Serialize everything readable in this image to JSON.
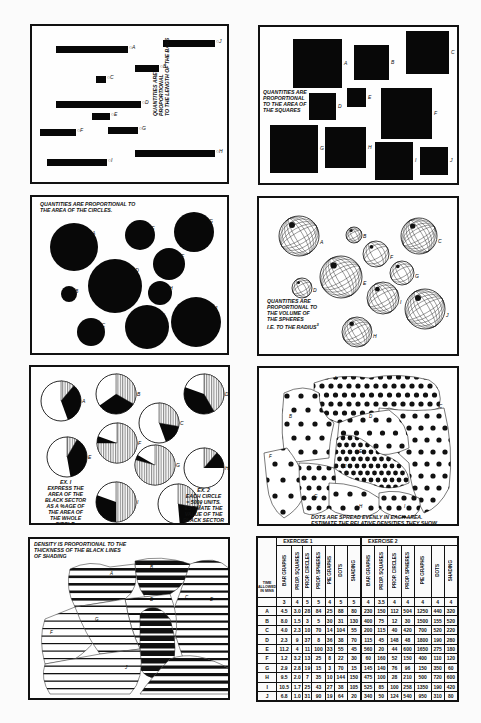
{
  "panels": {
    "bars": {
      "caption_line1": "QUANTITIES ARE PROPORTIONAL",
      "caption_line2": "TO THE LENGTH OF THE BARS",
      "items": [
        {
          "label": "A",
          "x": 16,
          "y": 20,
          "w": 72
        },
        {
          "label": "B",
          "x": 95,
          "y": 39,
          "w": 24
        },
        {
          "label": "C",
          "x": 56,
          "y": 50,
          "w": 10
        },
        {
          "label": "D",
          "x": 16,
          "y": 75,
          "w": 85
        },
        {
          "label": "E",
          "x": 52,
          "y": 87,
          "w": 18
        },
        {
          "label": "F",
          "x": 0,
          "y": 103,
          "w": 36
        },
        {
          "label": "G",
          "x": 68,
          "y": 101,
          "w": 30
        },
        {
          "label": "H",
          "x": 95,
          "y": 124,
          "w": 80
        },
        {
          "label": "I",
          "x": 7,
          "y": 133,
          "w": 60
        },
        {
          "label": "J",
          "x": 123,
          "y": 14,
          "w": 52
        }
      ]
    },
    "squares": {
      "caption_line1": "QUANTITIES ARE",
      "caption_line2": "PROPORTIONAL",
      "caption_line3": "TO THE AREA OF",
      "caption_line4": "THE SQUARES",
      "items": [
        {
          "label": "A",
          "x": 33,
          "y": 12,
          "s": 49
        },
        {
          "label": "B",
          "x": 94,
          "y": 18,
          "s": 35
        },
        {
          "label": "C",
          "x": 146,
          "y": 4,
          "s": 43
        },
        {
          "label": "D",
          "x": 49,
          "y": 66,
          "s": 27
        },
        {
          "label": "E",
          "x": 87,
          "y": 61,
          "s": 19
        },
        {
          "label": "F",
          "x": 121,
          "y": 61,
          "s": 51
        },
        {
          "label": "G",
          "x": 10,
          "y": 98,
          "s": 48
        },
        {
          "label": "H",
          "x": 65,
          "y": 100,
          "s": 41
        },
        {
          "label": "I",
          "x": 115,
          "y": 115,
          "s": 38
        },
        {
          "label": "J",
          "x": 160,
          "y": 120,
          "s": 28
        }
      ]
    },
    "circles": {
      "caption_line1": "QUANTITIES ARE PROPORTIONAL TO",
      "caption_line2": "THE AREA OF THE CIRCLES.",
      "items": [
        {
          "label": "A",
          "cx": 42,
          "cy": 50,
          "r": 24
        },
        {
          "label": "B",
          "cx": 37,
          "cy": 97,
          "r": 8
        },
        {
          "label": "C",
          "cx": 59,
          "cy": 135,
          "r": 14
        },
        {
          "label": "D",
          "cx": 83,
          "cy": 89,
          "r": 27
        },
        {
          "label": "E",
          "cx": 108,
          "cy": 38,
          "r": 15
        },
        {
          "label": "F",
          "cx": 137,
          "cy": 67,
          "r": 16
        },
        {
          "label": "G",
          "cx": 162,
          "cy": 35,
          "r": 20
        },
        {
          "label": "H",
          "cx": 128,
          "cy": 96,
          "r": 12
        },
        {
          "label": "I",
          "cx": 115,
          "cy": 130,
          "r": 22
        },
        {
          "label": "J",
          "cx": 164,
          "cy": 125,
          "r": 25
        }
      ]
    },
    "spheres": {
      "caption_line1": "QUANTITIES ARE",
      "caption_line2": "PROPORTIONAL TO",
      "caption_line3": "THE VOLUME OF",
      "caption_line4": "THE SPHERES",
      "caption_line5": "i.e. TO THE RADIUS",
      "caption_sup": "3",
      "items": [
        {
          "label": "A",
          "cx": 40,
          "cy": 38,
          "r": 20
        },
        {
          "label": "B",
          "cx": 95,
          "cy": 37,
          "r": 8
        },
        {
          "label": "C",
          "cx": 160,
          "cy": 38,
          "r": 18
        },
        {
          "label": "D",
          "cx": 43,
          "cy": 90,
          "r": 10
        },
        {
          "label": "E",
          "cx": 82,
          "cy": 79,
          "r": 21
        },
        {
          "label": "F",
          "cx": 117,
          "cy": 56,
          "r": 13
        },
        {
          "label": "G",
          "cx": 143,
          "cy": 75,
          "r": 12
        },
        {
          "label": "H",
          "cx": 98,
          "cy": 134,
          "r": 15
        },
        {
          "label": "I",
          "cx": 124,
          "cy": 100,
          "r": 16
        },
        {
          "label": "J",
          "cx": 166,
          "cy": 111,
          "r": 20
        }
      ]
    },
    "pies": {
      "ex1_line1": "EX. I",
      "ex1_line2": "EXPRESS THE",
      "ex1_line3": "AREA OF THE",
      "ex1_line4": "BLACK SECTOR",
      "ex1_line5": "AS A %AGE OF",
      "ex1_line6": "THE AREA OF",
      "ex1_line7": "THE WHOLE",
      "ex1_line8": "CIRCLE.",
      "ex2_line1": "EX. 2",
      "ex2_line2": "EACH CIRCLE",
      "ex2_line3": "= 5000 UNITS.",
      "ex2_line4": "ESTIMATE THE",
      "ex2_line5": "VALUE OF THE",
      "ex2_line6": "BLACK SECTOR",
      "items": [
        {
          "label": "A",
          "cx": 30,
          "cy": 34,
          "r": 20,
          "hatch": [
            0,
            40
          ],
          "black": [
            40,
            160
          ]
        },
        {
          "label": "B",
          "cx": 85,
          "cy": 27,
          "r": 20,
          "hatch": [
            0,
            120
          ],
          "black": [
            120,
            235
          ]
        },
        {
          "label": "C",
          "cx": 128,
          "cy": 56,
          "r": 20,
          "hatch": [
            0,
            100
          ],
          "black": [
            100,
            160
          ]
        },
        {
          "label": "D",
          "cx": 173,
          "cy": 27,
          "r": 20,
          "hatch": [
            0,
            150
          ],
          "black": [
            150,
            290
          ]
        },
        {
          "label": "E",
          "cx": 36,
          "cy": 90,
          "r": 20,
          "hatch": [
            0,
            30
          ],
          "black": [
            30,
            170
          ]
        },
        {
          "label": "F",
          "cx": 86,
          "cy": 76,
          "r": 20,
          "hatch": [
            0,
            270
          ],
          "black": [
            270,
            290
          ]
        },
        {
          "label": "G",
          "cx": 124,
          "cy": 98,
          "r": 20,
          "hatch": [
            0,
            285
          ],
          "black": [
            285,
            300
          ]
        },
        {
          "label": "H",
          "cx": 173,
          "cy": 101,
          "r": 20,
          "hatch": [
            0,
            40
          ],
          "black": [
            40,
            90
          ]
        },
        {
          "label": "I",
          "cx": 85,
          "cy": 135,
          "r": 20,
          "hatch": [
            0,
            180
          ],
          "black": [
            180,
            290
          ]
        },
        {
          "label": "J",
          "cx": 147,
          "cy": 137,
          "r": 20,
          "hatch": [
            0,
            100
          ],
          "black": [
            100,
            175
          ]
        }
      ]
    },
    "dots": {
      "caption_line1": "DOTS ARE SPREAD EVENLY IN EACH AREA.",
      "caption_line2": "ESTIMATE THE RELATIVE DENSITIES THEY SHOW",
      "region_labels": [
        "A",
        "B",
        "C",
        "D",
        "E",
        "F",
        "G",
        "H",
        "I",
        "J"
      ]
    },
    "shading": {
      "caption_line1": "DENSITY IS PROPORTIONAL TO THE",
      "caption_line2": "THICKNESS OF THE BLACK LINES",
      "caption_line3": "OF SHADING",
      "region_labels": [
        "A",
        "B",
        "C",
        "D",
        "E",
        "F",
        "G",
        "J"
      ]
    },
    "table": {
      "exercise1_title": "EXERCISE 1",
      "exercise2_title": "EXERCISE 2",
      "corner_label": "TIME ALLOWED IN MINS",
      "columns": [
        "BAR GRAPHS",
        "PROP. SQUARES",
        "PROP. CIRCLES",
        "PROP. SPHERES",
        "PIE GRAPHS",
        "DOTS",
        "SHADING"
      ],
      "time_row": {
        "ex1": [
          "3",
          "4",
          "5",
          "5",
          "4",
          "5",
          "5"
        ],
        "ex2": [
          "4",
          "3.5",
          "4",
          "4",
          "4",
          "4",
          "4"
        ]
      },
      "rows": [
        {
          "label": "A",
          "ex1": [
            "4.5",
            "3.0",
            "28",
            "84",
            "25",
            "88",
            "80"
          ],
          "ex2": [
            "230",
            "150",
            "112",
            "504",
            "1250",
            "440",
            "320"
          ]
        },
        {
          "label": "B",
          "ex1": [
            "8.0",
            "1.5",
            "3",
            "5",
            "30",
            "31",
            "130"
          ],
          "ex2": [
            "400",
            "75",
            "12",
            "30",
            "1500",
            "155",
            "520"
          ]
        },
        {
          "label": "C",
          "ex1": [
            "4.0",
            "2.3",
            "10",
            "70",
            "14",
            "104",
            "55"
          ],
          "ex2": [
            "200",
            "115",
            "40",
            "420",
            "700",
            "520",
            "220"
          ]
        },
        {
          "label": "D",
          "ex1": [
            "2.3",
            "9",
            "37",
            "8",
            "36",
            "38",
            "70"
          ],
          "ex2": [
            "115",
            "45",
            "148",
            "48",
            "1800",
            "190",
            "280"
          ]
        },
        {
          "label": "E",
          "ex1": [
            "11.2",
            "4",
            "11",
            "100",
            "33",
            "55",
            "45"
          ],
          "ex2": [
            "560",
            "20",
            "44",
            "600",
            "1650",
            "275",
            "180"
          ]
        },
        {
          "label": "F",
          "ex1": [
            "1.2",
            "3.2",
            "13",
            "25",
            "8",
            "22",
            "30"
          ],
          "ex2": [
            "60",
            "160",
            "52",
            "150",
            "400",
            "110",
            "120"
          ]
        },
        {
          "label": "G",
          "ex1": [
            "2.9",
            "2.8",
            "19",
            "15",
            "3",
            "70",
            "15"
          ],
          "ex2": [
            "145",
            "140",
            "76",
            "96",
            "150",
            "350",
            "60"
          ]
        },
        {
          "label": "H",
          "ex1": [
            "9.5",
            "2.0",
            "7",
            "35",
            "10",
            "144",
            "150"
          ],
          "ex2": [
            "475",
            "100",
            "28",
            "210",
            "500",
            "720",
            "600"
          ]
        },
        {
          "label": "I",
          "ex1": [
            "10.5",
            "1.7",
            "25",
            "43",
            "27",
            "38",
            "105"
          ],
          "ex2": [
            "525",
            "85",
            "100",
            "258",
            "1350",
            "190",
            "420"
          ]
        },
        {
          "label": "J",
          "ex1": [
            "6.8",
            "1.0",
            "31",
            "90",
            "19",
            "64",
            "20"
          ],
          "ex2": [
            "340",
            "50",
            "124",
            "540",
            "950",
            "310",
            "80"
          ]
        }
      ]
    }
  }
}
